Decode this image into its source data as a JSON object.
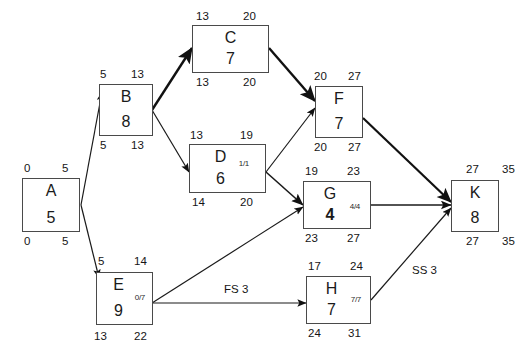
{
  "diagram": {
    "type": "project-network-precedence-diagram",
    "nodes": [
      {
        "id": "A",
        "name": "A",
        "duration": "5",
        "subscript": "",
        "early_start": "0",
        "early_finish": "5",
        "late_start": "0",
        "late_finish": "5"
      },
      {
        "id": "B",
        "name": "B",
        "duration": "8",
        "subscript": "",
        "early_start": "5",
        "early_finish": "13",
        "late_start": "5",
        "late_finish": "13"
      },
      {
        "id": "C",
        "name": "C",
        "duration": "7",
        "subscript": "",
        "early_start": "13",
        "early_finish": "20",
        "late_start": "13",
        "late_finish": "20"
      },
      {
        "id": "D",
        "name": "D",
        "duration": "6",
        "subscript": "1/1",
        "early_start": "13",
        "early_finish": "19",
        "late_start": "14",
        "late_finish": "20"
      },
      {
        "id": "E",
        "name": "E",
        "duration": "9",
        "subscript": "0/7",
        "early_start": "5",
        "early_finish": "14",
        "late_start": "13",
        "late_finish": "22"
      },
      {
        "id": "F",
        "name": "F",
        "duration": "7",
        "subscript": "",
        "early_start": "20",
        "early_finish": "27",
        "late_start": "20",
        "late_finish": "27"
      },
      {
        "id": "G",
        "name": "G",
        "duration": "4",
        "subscript": "4/4",
        "early_start": "19",
        "early_finish": "23",
        "late_start": "23",
        "late_finish": "27"
      },
      {
        "id": "H",
        "name": "H",
        "duration": "7",
        "subscript": "7/7",
        "early_start": "17",
        "early_finish": "24",
        "late_start": "24",
        "late_finish": "31"
      },
      {
        "id": "K",
        "name": "K",
        "duration": "8",
        "subscript": "",
        "early_start": "27",
        "early_finish": "35",
        "late_start": "27",
        "late_finish": "35"
      }
    ],
    "edges": [
      {
        "from": "A",
        "to": "B",
        "label": "",
        "critical": false
      },
      {
        "from": "A",
        "to": "E",
        "label": "",
        "critical": false
      },
      {
        "from": "B",
        "to": "C",
        "label": "",
        "critical": true
      },
      {
        "from": "B",
        "to": "D",
        "label": "",
        "critical": false
      },
      {
        "from": "C",
        "to": "F",
        "label": "",
        "critical": true
      },
      {
        "from": "D",
        "to": "F",
        "label": "",
        "critical": false
      },
      {
        "from": "D",
        "to": "G",
        "label": "",
        "critical": false
      },
      {
        "from": "E",
        "to": "G",
        "label": "",
        "critical": false
      },
      {
        "from": "E",
        "to": "H",
        "label": "FS 3",
        "critical": false
      },
      {
        "from": "F",
        "to": "K",
        "label": "",
        "critical": true
      },
      {
        "from": "G",
        "to": "K",
        "label": "",
        "critical": false
      },
      {
        "from": "H",
        "to": "K",
        "label": "SS 3",
        "critical": false
      }
    ],
    "edge_labels": {
      "e_h": "FS 3",
      "h_k": "SS 3"
    },
    "colors": {
      "node_border": "#4a4a4a",
      "edge": "#1a1a1a",
      "text": "#151515",
      "background": "#ffffff"
    }
  }
}
